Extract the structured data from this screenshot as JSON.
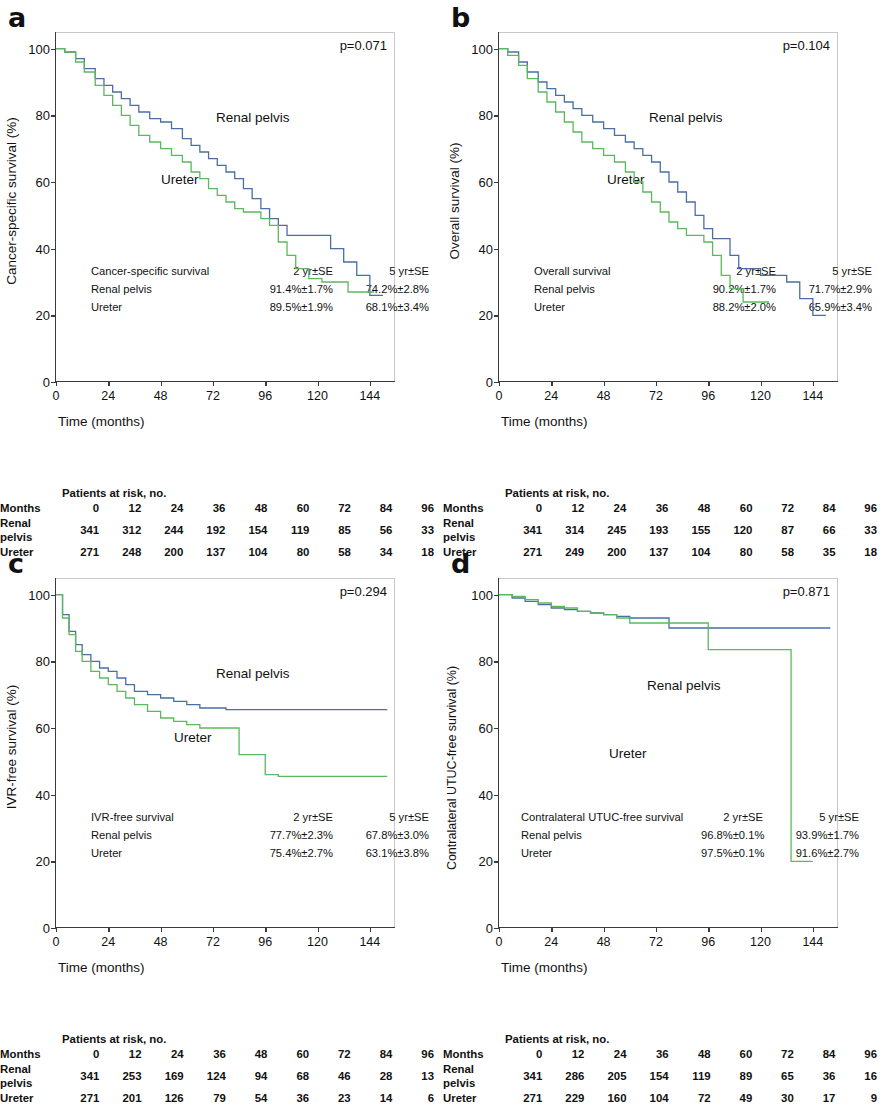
{
  "figure": {
    "x_ticks": [
      0,
      24,
      48,
      72,
      96,
      120,
      144
    ],
    "y_ticks": [
      0,
      20,
      40,
      60,
      80,
      100
    ],
    "x_axis_title": "Time (months)",
    "risk_title": "Patients at risk, no.",
    "risk_months_label": "Months",
    "risk_row_labels": [
      "Renal pelvis",
      "Ureter"
    ],
    "risk_months": [
      0,
      12,
      24,
      36,
      48,
      60,
      72,
      84,
      96
    ],
    "series_names": [
      "Renal pelvis",
      "Ureter"
    ],
    "colors": {
      "renal_pelvis": "#4a6fa5",
      "ureter": "#5cb85c"
    },
    "stats_headers": [
      "2 yr±SE",
      "5 yr±SE"
    ]
  },
  "panels": [
    {
      "letter": "a",
      "ylabel": "Cancer-specific survival (%)",
      "p_value": "p=0.071",
      "label_renal": "Renal pelvis",
      "label_ureter": "Ureter",
      "stats_title": "Cancer-specific survival",
      "stats": [
        {
          "label": "Renal pelvis",
          "yr2": "91.4%±1.7%",
          "yr5": "74.2%±2.8%"
        },
        {
          "label": "Ureter",
          "yr2": "89.5%±1.9%",
          "yr5": "68.1%±3.4%"
        }
      ],
      "risk": {
        "renal_pelvis": [
          341,
          312,
          244,
          192,
          154,
          119,
          85,
          56,
          33
        ],
        "ureter": [
          271,
          248,
          200,
          137,
          104,
          80,
          58,
          34,
          18
        ]
      },
      "chart_data": {
        "type": "line",
        "title": "Cancer-specific survival",
        "xlabel": "Time (months)",
        "ylabel": "Cancer-specific survival (%)",
        "xlim": [
          0,
          156
        ],
        "ylim": [
          0,
          105
        ],
        "grid": false,
        "legend": "inline-annotation",
        "series": [
          {
            "name": "Renal pelvis",
            "color": "#4a6fa5",
            "x": [
              0,
              4,
              9,
              13,
              18,
              22,
              26,
              30,
              34,
              38,
              43,
              48,
              53,
              58,
              62,
              66,
              70,
              74,
              78,
              82,
              86,
              90,
              94,
              98,
              102,
              106,
              110,
              114,
              120,
              126,
              132,
              138,
              144,
              150
            ],
            "y": [
              100,
              99,
              97,
              94,
              91,
              89,
              87,
              85,
              83,
              81,
              79,
              78,
              76,
              73,
              71,
              69,
              67,
              65,
              63,
              61,
              58,
              55,
              52,
              49,
              47,
              44,
              44,
              44,
              44,
              40,
              36,
              32,
              26,
              26
            ]
          },
          {
            "name": "Ureter",
            "color": "#5cb85c",
            "x": [
              0,
              4,
              9,
              13,
              18,
              22,
              26,
              30,
              34,
              38,
              43,
              48,
              53,
              58,
              62,
              66,
              70,
              74,
              78,
              82,
              86,
              90,
              94,
              98,
              102,
              106,
              110,
              116,
              122,
              128,
              134,
              140,
              146
            ],
            "y": [
              100,
              99,
              96,
              93,
              89,
              86,
              83,
              80,
              77,
              74,
              72,
              70,
              68,
              66,
              63,
              61,
              58,
              56,
              54,
              52,
              51,
              51,
              49,
              47,
              42,
              38,
              34,
              31,
              30,
              30,
              27,
              27,
              27
            ]
          }
        ]
      }
    },
    {
      "letter": "b",
      "ylabel": "Overall survival (%)",
      "p_value": "p=0.104",
      "label_renal": "Renal pelvis",
      "label_ureter": "Ureter",
      "stats_title": "Overall survival",
      "stats": [
        {
          "label": "Renal pelvis",
          "yr2": "90.2%±1.7%",
          "yr5": "71.7%±2.9%"
        },
        {
          "label": "Ureter",
          "yr2": "88.2%±2.0%",
          "yr5": "65.9%±3.4%"
        }
      ],
      "risk": {
        "renal_pelvis": [
          341,
          314,
          245,
          193,
          155,
          120,
          87,
          66,
          33
        ],
        "ureter": [
          271,
          249,
          200,
          137,
          104,
          80,
          58,
          35,
          18
        ]
      },
      "chart_data": {
        "type": "line",
        "title": "Overall survival",
        "xlabel": "Time (months)",
        "ylabel": "Overall survival (%)",
        "xlim": [
          0,
          156
        ],
        "ylim": [
          0,
          105
        ],
        "grid": false,
        "legend": "inline-annotation",
        "series": [
          {
            "name": "Renal pelvis",
            "color": "#4a6fa5",
            "x": [
              0,
              4,
              9,
              13,
              18,
              22,
              26,
              30,
              34,
              38,
              43,
              48,
              53,
              58,
              62,
              66,
              70,
              74,
              78,
              82,
              86,
              90,
              94,
              98,
              102,
              106,
              110,
              114,
              120,
              126,
              132,
              138,
              144,
              150
            ],
            "y": [
              100,
              99,
              96,
              93,
              90,
              88,
              86,
              84,
              82,
              80,
              78,
              76,
              74,
              72,
              70,
              68,
              66,
              63,
              60,
              57,
              54,
              50,
              46,
              43,
              43,
              38,
              34,
              34,
              32,
              32,
              30,
              25,
              20,
              20
            ]
          },
          {
            "name": "Ureter",
            "color": "#5cb85c",
            "x": [
              0,
              4,
              9,
              13,
              18,
              22,
              26,
              30,
              34,
              38,
              43,
              48,
              53,
              58,
              62,
              66,
              70,
              74,
              78,
              82,
              86,
              90,
              94,
              98,
              102,
              106,
              112,
              118,
              124
            ],
            "y": [
              100,
              98,
              95,
              91,
              87,
              84,
              81,
              78,
              75,
              72,
              70,
              68,
              66,
              63,
              60,
              57,
              54,
              51,
              48,
              46,
              44,
              44,
              42,
              38,
              32,
              28,
              24,
              24,
              24
            ]
          }
        ]
      }
    },
    {
      "letter": "c",
      "ylabel": "IVR-free survival (%)",
      "p_value": "p=0.294",
      "label_renal": "Renal pelvis",
      "label_ureter": "Ureter",
      "stats_title": "IVR-free survival",
      "stats": [
        {
          "label": "Renal pelvis",
          "yr2": "77.7%±2.3%",
          "yr5": "67.8%±3.0%"
        },
        {
          "label": "Ureter",
          "yr2": "75.4%±2.7%",
          "yr5": "63.1%±3.8%"
        }
      ],
      "risk": {
        "renal_pelvis": [
          341,
          253,
          169,
          124,
          94,
          68,
          46,
          28,
          13
        ],
        "ureter": [
          271,
          201,
          126,
          79,
          54,
          36,
          23,
          14,
          6
        ]
      },
      "chart_data": {
        "type": "line",
        "title": "IVR-free survival",
        "xlabel": "Time (months)",
        "ylabel": "IVR-free survival (%)",
        "xlim": [
          0,
          156
        ],
        "ylim": [
          0,
          105
        ],
        "grid": false,
        "legend": "inline-annotation",
        "series": [
          {
            "name": "Renal pelvis",
            "color": "#4a6fa5",
            "x": [
              0,
              3,
              6,
              9,
              12,
              16,
              20,
              24,
              28,
              32,
              36,
              42,
              48,
              54,
              60,
              66,
              72,
              78,
              84,
              96,
              108,
              120,
              132,
              144,
              152
            ],
            "y": [
              100,
              94,
              89,
              85,
              82,
              80,
              78,
              77,
              75,
              73,
              71,
              70,
              69,
              68,
              67,
              66,
              66,
              65.5,
              65.5,
              65.5,
              65.5,
              65.5,
              65.5,
              65.5,
              65.5
            ]
          },
          {
            "name": "Ureter",
            "color": "#5cb85c",
            "x": [
              0,
              3,
              6,
              9,
              12,
              16,
              20,
              24,
              28,
              32,
              36,
              42,
              48,
              54,
              60,
              66,
              72,
              78,
              84,
              90,
              96,
              102,
              108,
              120,
              132,
              144,
              152
            ],
            "y": [
              100,
              93,
              88,
              83,
              80,
              77,
              75,
              73,
              71,
              69,
              67,
              65,
              63,
              62,
              61,
              60,
              60,
              60,
              52,
              52,
              46,
              45.5,
              45.5,
              45.5,
              45.5,
              45.5,
              45.5
            ]
          }
        ]
      }
    },
    {
      "letter": "d",
      "ylabel": "Contralateral UTUC-free survival (%)",
      "p_value": "p=0.871",
      "label_renal": "Renal pelvis",
      "label_ureter": "Ureter",
      "stats_title": "Contralateral UTUC-free survival",
      "stats": [
        {
          "label": "Renal pelvis",
          "yr2": "96.8%±0.1%",
          "yr5": "93.9%±1.7%"
        },
        {
          "label": "Ureter",
          "yr2": "97.5%±0.1%",
          "yr5": "91.6%±2.7%"
        }
      ],
      "risk": {
        "renal_pelvis": [
          341,
          286,
          205,
          154,
          119,
          89,
          65,
          36,
          16
        ],
        "ureter": [
          271,
          229,
          160,
          104,
          72,
          49,
          30,
          17,
          9
        ]
      },
      "chart_data": {
        "type": "line",
        "title": "Contralateral UTUC-free survival",
        "xlabel": "Time (months)",
        "ylabel": "Contralateral UTUC-free survival (%)",
        "xlim": [
          0,
          156
        ],
        "ylim": [
          0,
          105
        ],
        "grid": false,
        "legend": "inline-annotation",
        "series": [
          {
            "name": "Renal pelvis",
            "color": "#4a6fa5",
            "x": [
              0,
              6,
              12,
              18,
              24,
              30,
              36,
              42,
              48,
              54,
              60,
              66,
              72,
              78,
              84,
              96,
              108,
              120,
              132,
              144,
              152
            ],
            "y": [
              100,
              99,
              98,
              97,
              96,
              95.5,
              95,
              94.5,
              94,
              93.5,
              93,
              93,
              93,
              90,
              90,
              90,
              90,
              90,
              90,
              90,
              90
            ]
          },
          {
            "name": "Ureter",
            "color": "#5cb85c",
            "x": [
              0,
              6,
              12,
              18,
              24,
              30,
              36,
              42,
              48,
              54,
              60,
              66,
              72,
              78,
              84,
              90,
              96,
              102,
              108,
              120,
              130,
              134,
              134,
              144
            ],
            "y": [
              100,
              99.5,
              98.5,
              97.5,
              96.5,
              96,
              95,
              94.5,
              94,
              93,
              91.5,
              91.5,
              91.5,
              91.5,
              91.5,
              91.5,
              83.5,
              83.5,
              83.5,
              83.5,
              83.5,
              83.5,
              20,
              20
            ]
          }
        ]
      }
    }
  ]
}
